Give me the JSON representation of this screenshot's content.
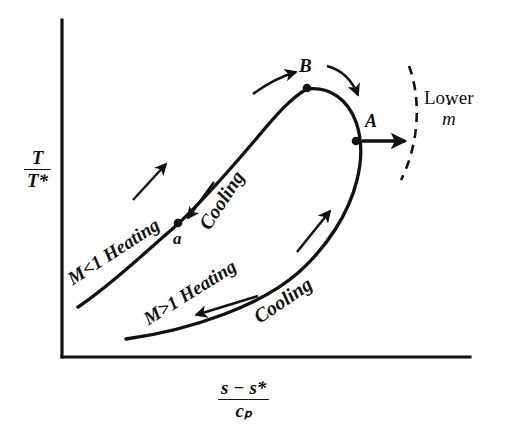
{
  "figure": {
    "kind": "rayleigh-line-diagram",
    "axes": {
      "y_label": {
        "numerator": "T",
        "denominator": "T*"
      },
      "x_label": {
        "numerator": "s − s*",
        "denominator": "cₚ"
      },
      "x_origin_px": 62,
      "y_origin_px": 357,
      "y_axis_top_px": 20,
      "x_axis_right_px": 470
    },
    "points": [
      {
        "id": "B",
        "label": "B",
        "x_px": 307,
        "y_px": 88,
        "description": "maximum temperature point at top of Rayleigh curve"
      },
      {
        "id": "A",
        "label": "A",
        "x_px": 355,
        "y_px": 141,
        "description": "maximum entropy point, sonic point M=1"
      },
      {
        "id": "a",
        "label": "a",
        "x_px": 178,
        "y_px": 223,
        "description": "state point on subsonic branch"
      }
    ],
    "branch_labels": [
      {
        "id": "heating-subsonic",
        "text": "M<1 Heating",
        "rotation_deg": -33
      },
      {
        "id": "cooling-upper",
        "text": "Cooling",
        "rotation_deg": -57
      },
      {
        "id": "heating-supersonic",
        "text": "M>1 Heating",
        "rotation_deg": -32
      },
      {
        "id": "cooling-lower",
        "text": "Cooling",
        "rotation_deg": -34
      }
    ],
    "annotation": {
      "text": "Lower",
      "symbol": "m",
      "symbol_accent": "dot",
      "meaning": "Lower mass flow rate"
    },
    "colors": {
      "ink": "#111111",
      "background": "#ffffff"
    },
    "curve": {
      "style": "solid",
      "stroke_width_px": 3,
      "shape": "Rayleigh line loop: subsonic branch rises from lower-left through a to B, rounds over through A, supersonic branch descends back to lower-left"
    },
    "dashed_arc": {
      "style": "dashed",
      "meaning": "locus for lower mass flow rate"
    },
    "arrows": [
      {
        "id": "arrow-heating-subsonic",
        "direction": "up-right",
        "on": "subsonic branch below a"
      },
      {
        "id": "arrow-cooling-upper",
        "direction": "down-left",
        "on": "subsonic branch toward a"
      },
      {
        "id": "arrow-heating-upper-to-B",
        "direction": "up-right",
        "on": "approach to B"
      },
      {
        "id": "arrow-cooling-B-to-A",
        "direction": "down-right",
        "on": "B to A over the nose"
      },
      {
        "id": "arrow-heating-supersonic",
        "direction": "up-right",
        "on": "supersonic branch toward A"
      },
      {
        "id": "arrow-cooling-lower",
        "direction": "down-left",
        "on": "lower supersonic branch"
      },
      {
        "id": "arrow-lower-mdot",
        "direction": "right",
        "on": "from A toward dashed arc"
      }
    ]
  }
}
